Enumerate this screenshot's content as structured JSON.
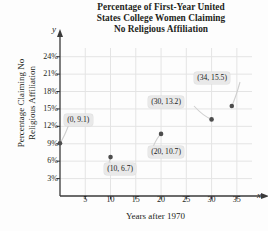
{
  "chart_data": {
    "type": "scatter",
    "title": "Percentage of First-Year United States College Women Claiming No Religious Affiliation",
    "title_lines": [
      "Percentage of First-Year United",
      "States College Women Claiming",
      "No Religious Affiliation"
    ],
    "xlabel": "Years after 1970",
    "ylabel": "Percentage Claiming No Religious Affiliation",
    "ylabel_lines": [
      "Percentage Claiming No",
      "Religious Affiliation"
    ],
    "x_axis_letter": "x",
    "y_axis_letter": "y",
    "xlim": [
      0,
      38
    ],
    "ylim": [
      0,
      25.5
    ],
    "xticks": [
      5,
      10,
      15,
      20,
      25,
      30,
      35
    ],
    "xtick_labels": [
      "5",
      "10",
      "15",
      "20",
      "25",
      "30",
      "35"
    ],
    "yticks": [
      3,
      6,
      9,
      12,
      15,
      18,
      21,
      24
    ],
    "ytick_labels": [
      "3%",
      "6%",
      "9%",
      "12%",
      "15%",
      "18%",
      "21%",
      "24%"
    ],
    "grid": true,
    "legend": null,
    "x": [
      0,
      10,
      20,
      30,
      34
    ],
    "y": [
      9.1,
      6.7,
      10.7,
      13.2,
      15.5
    ],
    "point_labels": [
      "(0, 9.1)",
      "(10, 6.7)",
      "(20, 10.7)",
      "(30, 13.2)",
      "(34, 15.5)"
    ],
    "colors": {
      "point": "#4d4d4d",
      "axis": "#3a3a3a",
      "grid": "#e4e4e4",
      "callout_bg": "#e9e9e9",
      "text": "#231f20",
      "background": "#fdfdfd"
    }
  }
}
